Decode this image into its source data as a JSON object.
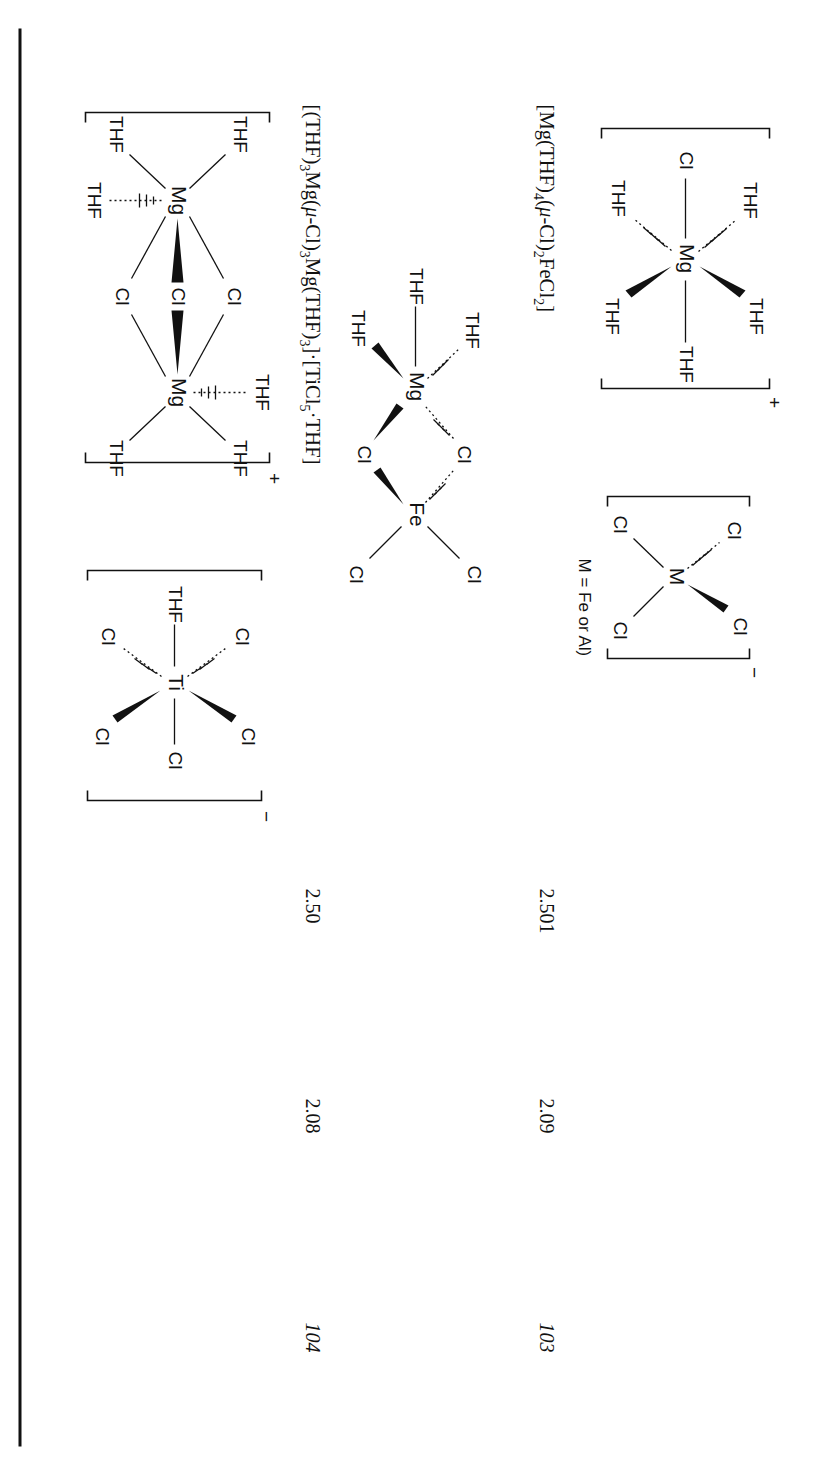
{
  "page": {
    "rotation_degrees": 90,
    "background": "#ffffff",
    "ink_color": "#111111",
    "rule": {
      "name": "horizontal-rule",
      "visible": true
    }
  },
  "table": {
    "rows": [
      {
        "compound_number": "103",
        "bond_length_a": "2.501",
        "bond_length_b": "2.09",
        "formula_text": "[Mg(THF)4(μ-Cl)2FeCl2]",
        "formula_parts": [
          "[Mg(THF)",
          "4",
          "(",
          "μ",
          "-Cl)",
          "2",
          "FeCl",
          "2",
          "]"
        ],
        "structures": [
          {
            "name": "mg-thf5-cl-cation",
            "center": "Mg",
            "charge": "+",
            "ligands": [
              "THF",
              "THF",
              "Cl",
              "THF",
              "THF",
              "THF"
            ]
          },
          {
            "name": "mcl4-anion",
            "center": "M",
            "charge": "−",
            "ligands": [
              "Cl",
              "Cl",
              "Cl",
              "Cl"
            ],
            "note": "M = Fe or Al)"
          }
        ]
      },
      {
        "compound_number": "104",
        "bond_length_a": "2.50",
        "bond_length_b": "2.08",
        "formula_text": "[(THF)3Mg(μ-Cl)3Mg(THF)3]·[TiCl5·THF]",
        "formula_parts": [
          "[(THF)",
          "3",
          "Mg(",
          "μ",
          "-Cl)",
          "3",
          "Mg(THF)",
          "3",
          "]·[TiCl",
          "5",
          "·THF]"
        ],
        "structures": [
          {
            "name": "mg2-cl3-dimer-cation",
            "centers": [
              "Mg",
              "Mg"
            ],
            "charge": "+",
            "bridges": [
              "Cl",
              "Cl",
              "Cl"
            ],
            "ligands": [
              "THF",
              "THF",
              "THF",
              "THF",
              "THF",
              "THF"
            ]
          },
          {
            "name": "ticl5-thf-anion",
            "center": "Ti",
            "charge": "−",
            "ligands": [
              "Cl",
              "Cl",
              "THF",
              "Cl",
              "Cl",
              "Cl"
            ]
          }
        ]
      }
    ],
    "extra_structure": {
      "name": "mg-thf4-cl2-fecl2-bridged",
      "centers": [
        "Fe",
        "Mg"
      ],
      "charge": "",
      "terminal_cl": [
        "Cl",
        "Cl"
      ],
      "bridges": [
        "Cl",
        "Cl"
      ],
      "ligands": [
        "THF",
        "THF",
        "THF",
        "THF"
      ]
    }
  },
  "labels": {
    "atom_cl": "Cl",
    "atom_mg": "Mg",
    "atom_fe": "Fe",
    "atom_ti": "Ti",
    "atom_m": "M",
    "ligand_thf": "THF",
    "charge_plus": "+",
    "charge_minus": "−"
  }
}
